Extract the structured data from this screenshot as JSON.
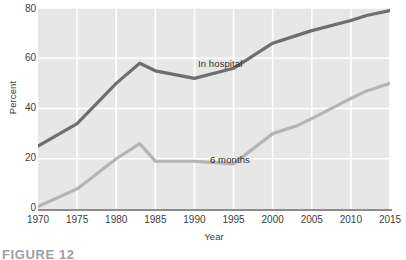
{
  "chart_data": {
    "type": "line",
    "title": "",
    "xlabel": "Year",
    "ylabel": "Percent",
    "xlim": [
      1970,
      2015
    ],
    "ylim": [
      0,
      80
    ],
    "grid": true,
    "legend_position": "inline-annotation",
    "x_ticks": [
      "1970",
      "1975",
      "1980",
      "1985",
      "1990",
      "1995",
      "2000",
      "2005",
      "2010",
      "2015"
    ],
    "y_ticks": [
      "0",
      "20",
      "40",
      "60",
      "80"
    ],
    "x": [
      1970,
      1975,
      1980,
      1983,
      1985,
      1990,
      1995,
      2000,
      2003,
      2005,
      2010,
      2012,
      2015
    ],
    "series": [
      {
        "name": "In hospital",
        "color": "#6e6e6e",
        "values": [
          25,
          34,
          50,
          58,
          55,
          52,
          56,
          66,
          69,
          71,
          75,
          77,
          79
        ]
      },
      {
        "name": "6 months",
        "color": "#b4b4b4",
        "values": [
          1,
          8,
          20,
          26,
          19,
          19,
          18,
          30,
          33,
          36,
          44,
          47,
          50
        ]
      }
    ],
    "annotations": [
      {
        "text": "In hospital",
        "x": 1990,
        "y": 61
      },
      {
        "text": "6 months",
        "x": 1992,
        "y": 26
      }
    ]
  },
  "figure": {
    "caption": "FIGURE 12"
  },
  "style": {
    "plot_background": "#e7e7e7",
    "gridline_color": "#ffffff",
    "axis_color": "#8d8d8d",
    "page_background": "#ffffff"
  }
}
